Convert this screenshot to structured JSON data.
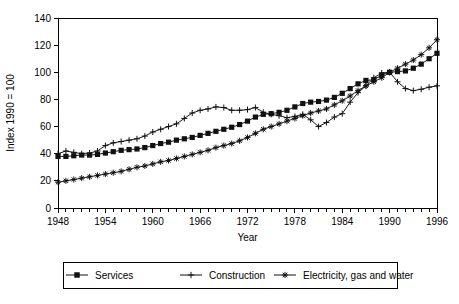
{
  "chart_data": {
    "type": "line",
    "title": "",
    "xlabel": "Year",
    "ylabel": "Index 1990 = 100",
    "xlim": [
      1948,
      1996
    ],
    "ylim": [
      0,
      140
    ],
    "ytick_step": 20,
    "yticks": [
      0,
      20,
      40,
      60,
      80,
      100,
      120,
      140
    ],
    "xticks_labeled": [
      1948,
      1954,
      1960,
      1966,
      1972,
      1978,
      1984,
      1990,
      1996
    ],
    "xtick_minor_step": 1,
    "grid": false,
    "legend_position": "bottom",
    "x": [
      1948,
      1949,
      1950,
      1951,
      1952,
      1953,
      1954,
      1955,
      1956,
      1957,
      1958,
      1959,
      1960,
      1961,
      1962,
      1963,
      1964,
      1965,
      1966,
      1967,
      1968,
      1969,
      1970,
      1971,
      1972,
      1973,
      1974,
      1975,
      1976,
      1977,
      1978,
      1979,
      1980,
      1981,
      1982,
      1983,
      1984,
      1985,
      1986,
      1987,
      1988,
      1989,
      1990,
      1991,
      1992,
      1993,
      1994,
      1995,
      1996
    ],
    "series": [
      {
        "name": "Services",
        "marker": "filled-square",
        "values": [
          38,
          38,
          38.5,
          39,
          39,
          39.5,
          40.5,
          41.5,
          42.5,
          43,
          43.5,
          44.5,
          46,
          47.5,
          48.5,
          50,
          51,
          52,
          53.5,
          55,
          56.5,
          58,
          59.5,
          61.5,
          64,
          67,
          69,
          69.5,
          70.5,
          72,
          74.5,
          77,
          78,
          78.5,
          79.5,
          81.5,
          84.5,
          88,
          91.5,
          94,
          94.5,
          98,
          100,
          100.5,
          101,
          103,
          106,
          110,
          114
        ]
      },
      {
        "name": "Construction",
        "marker": "plus",
        "values": [
          40,
          42,
          41,
          40,
          40.5,
          42,
          46,
          48,
          49,
          50,
          51,
          53,
          56,
          58,
          60,
          62,
          66,
          70,
          72,
          73,
          74.5,
          74,
          72,
          72,
          72.5,
          74,
          70.5,
          69,
          68,
          66.5,
          67.5,
          69,
          65,
          60,
          63,
          67,
          69.5,
          78,
          85,
          90,
          96,
          99.5,
          100,
          93,
          88,
          86.5,
          87.5,
          89,
          90
        ]
      },
      {
        "name": "Electricity, gas and water",
        "marker": "asterisk",
        "values": [
          19,
          20,
          21,
          22,
          23,
          24,
          25,
          26,
          27,
          28.5,
          30,
          31,
          32.5,
          34,
          35,
          36.5,
          38,
          39.5,
          41,
          42.5,
          44.5,
          46,
          47.5,
          49.5,
          52,
          55,
          58,
          60,
          62,
          64,
          66,
          68,
          70,
          71.5,
          73,
          76,
          79,
          82.5,
          86.5,
          90,
          93,
          96,
          100,
          103,
          106,
          109,
          113,
          118,
          124
        ]
      }
    ]
  },
  "legend": {
    "items": [
      {
        "label": "Services",
        "marker": "filled-square"
      },
      {
        "label": "Construction",
        "marker": "plus"
      },
      {
        "label": "Electricity, gas and water",
        "marker": "asterisk"
      }
    ]
  }
}
